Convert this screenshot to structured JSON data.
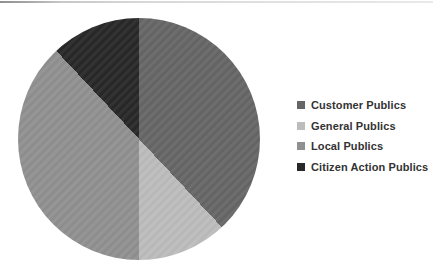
{
  "page": {
    "background": "#ffffff",
    "top_rule_colors": [
      "#8f8f8f",
      "#d6d6d6",
      "#e9e9e9"
    ]
  },
  "chart_data": {
    "type": "pie",
    "title": "",
    "unit": "percent",
    "start_angle_deg": 0,
    "direction": "clockwise",
    "legend_position": "right",
    "series": [
      {
        "label": "Customer Publics",
        "value": 38,
        "color": "#666666"
      },
      {
        "label": "General Publics",
        "value": 12,
        "color": "#bcbcbc"
      },
      {
        "label": "Local Publics",
        "value": 38,
        "color": "#909090"
      },
      {
        "label": "Citizen Action Publics",
        "value": 12,
        "color": "#282828"
      }
    ],
    "text_color": "#333333"
  }
}
